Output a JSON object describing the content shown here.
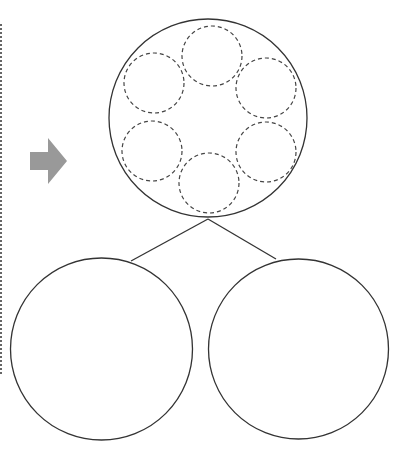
{
  "diagram": {
    "colors": {
      "stroke": "#333333",
      "dashed_stroke": "#444444",
      "arrow_fill": "#999999",
      "boundary": "#666666",
      "background": "#ffffff"
    },
    "boundary_line": {
      "x": 1,
      "y1": 24,
      "y2": 374,
      "style": "dotted"
    },
    "arrow": {
      "direction": "right",
      "points": "30,152 48,152 48,138 67,161 48,184 48,170 30,170"
    },
    "parent_circle": {
      "cx": 208,
      "cy": 118,
      "r": 99,
      "inner_circles": [
        {
          "id": "top",
          "cx": 212,
          "cy": 56,
          "r": 30
        },
        {
          "id": "upper-left",
          "cx": 154,
          "cy": 83,
          "r": 30
        },
        {
          "id": "upper-right",
          "cx": 266,
          "cy": 88,
          "r": 30
        },
        {
          "id": "lower-left",
          "cx": 152,
          "cy": 151,
          "r": 30
        },
        {
          "id": "lower-right",
          "cx": 266,
          "cy": 152,
          "r": 30
        },
        {
          "id": "bottom",
          "cx": 209,
          "cy": 183,
          "r": 30
        }
      ]
    },
    "connectors": [
      {
        "x1": 208,
        "y1": 219,
        "x2": 131,
        "y2": 261
      },
      {
        "x1": 208,
        "y1": 219,
        "x2": 276,
        "y2": 259
      }
    ],
    "child_circles": [
      {
        "id": "left",
        "cx": 101.5,
        "cy": 349,
        "r": 91
      },
      {
        "id": "right",
        "cx": 298.5,
        "cy": 349,
        "r": 90
      }
    ]
  }
}
